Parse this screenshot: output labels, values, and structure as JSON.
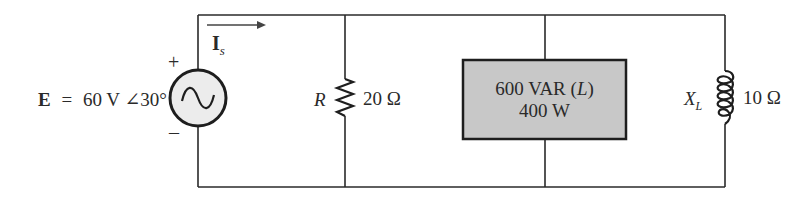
{
  "source": {
    "symbol": "E",
    "equals": "=",
    "value": "60 V ∠30°",
    "plus": "+",
    "minus": "–",
    "type": "ac-voltage-source"
  },
  "current": {
    "symbol": "I",
    "subscript": "s",
    "direction": "right"
  },
  "resistor": {
    "symbol": "R",
    "value": "20 Ω"
  },
  "load": {
    "line1_value": "600 VAR (",
    "line1_italic": "L",
    "line1_close": ")",
    "line2": "400 W",
    "fill_color": "#c8c8c8"
  },
  "inductor": {
    "symbol": "X",
    "subscript": "L",
    "value": "10 Ω"
  },
  "colors": {
    "wire": "#2a2a2a",
    "source_fill": "#ececec"
  }
}
